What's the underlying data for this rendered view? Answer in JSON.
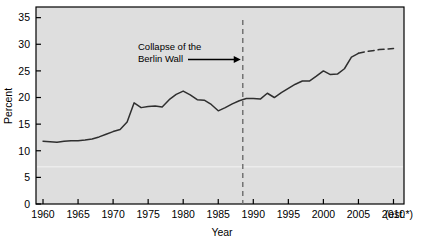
{
  "chart_data": {
    "type": "line",
    "title": "",
    "xlabel": "Year",
    "ylabel": "Percent",
    "xlim": [
      1959,
      2011.5
    ],
    "ylim": [
      0,
      37
    ],
    "grid": false,
    "legend": "none",
    "x_ticks": [
      "1960",
      "1965",
      "1970",
      "1975",
      "1980",
      "1985",
      "1990",
      "1995",
      "2000",
      "2005",
      "2010"
    ],
    "x_tick_suffix": "(est.*)",
    "y_ticks": [
      "0",
      "5",
      "10",
      "15",
      "20",
      "25",
      "30",
      "35"
    ],
    "annotations": [
      {
        "name": "berlin-wall-marker",
        "line1": "Collapse of the",
        "line2": "Berlin Wall",
        "arrow": "→",
        "x_value": 1988.5,
        "style": "dashed-vertical-line"
      }
    ],
    "series": [
      {
        "name": "actual",
        "style": "solid",
        "x": [
          1960,
          1961,
          1962,
          1963,
          1964,
          1965,
          1966,
          1967,
          1968,
          1969,
          1970,
          1971,
          1972,
          1973,
          1974,
          1975,
          1976,
          1977,
          1978,
          1979,
          1980,
          1981,
          1982,
          1983,
          1984,
          1985,
          1986,
          1987,
          1988,
          1989,
          1990,
          1991,
          1992,
          1993,
          1994,
          1995,
          1996,
          1997,
          1998,
          1999,
          2000,
          2001,
          2002,
          2003,
          2004,
          2005
        ],
        "values": [
          11.8,
          11.7,
          11.6,
          11.8,
          11.9,
          11.9,
          12.0,
          12.2,
          12.6,
          13.1,
          13.6,
          14.0,
          15.4,
          19.0,
          18.1,
          18.3,
          18.4,
          18.2,
          19.6,
          20.6,
          21.2,
          20.5,
          19.6,
          19.5,
          18.7,
          17.5,
          18.1,
          18.8,
          19.4,
          19.8,
          19.8,
          19.7,
          20.8,
          20.0,
          20.9,
          21.7,
          22.5,
          23.1,
          23.1,
          24.0,
          25.0,
          24.3,
          24.4,
          25.4,
          27.6,
          28.3
        ]
      },
      {
        "name": "projection",
        "style": "dashed",
        "x": [
          2005,
          2006,
          2007,
          2008,
          2009,
          2010
        ],
        "values": [
          28.3,
          28.6,
          28.8,
          29.0,
          29.1,
          29.2
        ]
      }
    ]
  },
  "colors": {
    "plot_background": "#dedede",
    "page_background": "#ffffff",
    "line": "#2f2f2f",
    "axis": "#000000",
    "marker_line": "#6b6b6b"
  }
}
